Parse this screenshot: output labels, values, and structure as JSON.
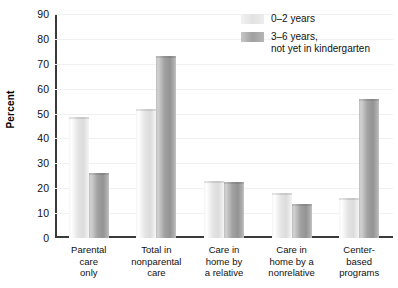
{
  "chart_data": {
    "type": "bar",
    "title": "",
    "xlabel": "",
    "ylabel": "Percent",
    "ylim": [
      0,
      90
    ],
    "ytick_step": 10,
    "yticks": [
      0,
      10,
      20,
      30,
      40,
      50,
      60,
      70,
      80,
      90
    ],
    "grid": true,
    "legend_position": "top-right",
    "categories": [
      "Parental\ncare\nonly",
      "Total in\nnonparental\ncare",
      "Care in\nhome by\na relative",
      "Care in\nhome by a\nnonrelative",
      "Center-\nbased\nprograms"
    ],
    "series": [
      {
        "name": "0–2 years",
        "color": "#e4e4e4",
        "values": [
          48.5,
          52,
          23,
          18,
          16
        ]
      },
      {
        "name": "3–6 years,\nnot yet in kindergarten",
        "color": "#a2a2a2",
        "values": [
          26,
          73,
          22.5,
          13.5,
          56
        ]
      }
    ]
  },
  "legend": {
    "items": [
      {
        "label": "0–2 years"
      },
      {
        "label": "3–6 years,\nnot yet in kindergarten"
      }
    ]
  }
}
